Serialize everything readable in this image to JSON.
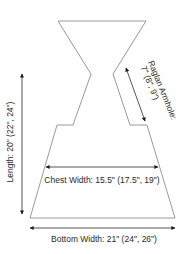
{
  "diagram": {
    "labels": {
      "raglan_line1": "Raglan Armhole:",
      "raglan_line2": "7\" (8\", 9\")",
      "length": "Length: 20\" (22\", 24\")",
      "chest": "Chest Width: 15.5\" (17.5\", 19\")",
      "bottom": "Bottom Width: 21\" (24\", 26\")"
    },
    "colors": {
      "outline": "#9a9a9a",
      "arrow": "#1a1a1a",
      "text": "#2a2a2a"
    }
  }
}
